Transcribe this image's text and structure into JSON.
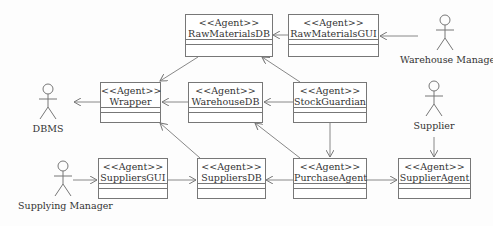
{
  "stereotype": "<<Agent>>",
  "agents": {
    "raw_materials_db": "RawMaterialsDB",
    "raw_materials_gui": "RawMaterialsGUI",
    "wrapper": "Wrapper",
    "warehouse_db": "WarehouseDB",
    "stock_guardian": "StockGuardian",
    "suppliers_gui": "SuppliersGUI",
    "suppliers_db": "SuppliersDB",
    "purchase_agent": "PurchaseAgent",
    "supplier_agent": "SupplierAgent"
  },
  "actors": {
    "warehouse_manager": "Warehouse Manager",
    "dbms": "DBMS",
    "supplier": "Supplier",
    "supplying_manager": "Supplying Manager"
  },
  "colors": {
    "line": "#777777",
    "text": "#333333"
  }
}
